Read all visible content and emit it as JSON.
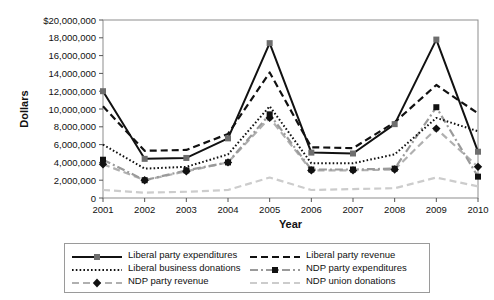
{
  "chart_data": {
    "type": "line",
    "title": "",
    "xlabel": "Year",
    "ylabel": "Dollars",
    "x": [
      2001,
      2002,
      2003,
      2004,
      2005,
      2006,
      2007,
      2008,
      2009,
      2010
    ],
    "categories": [
      "2001",
      "2002",
      "2003",
      "2004",
      "2005",
      "2006",
      "2007",
      "2008",
      "2009",
      "2010"
    ],
    "ylim": [
      0,
      20000000
    ],
    "ytick_values": [
      0,
      2000000,
      4000000,
      6000000,
      8000000,
      10000000,
      12000000,
      14000000,
      16000000,
      18000000,
      20000000
    ],
    "ytick_labels": [
      "0",
      "2,000,000",
      "4,000,000",
      "6,000,000",
      "8,000,000",
      "10,000,000",
      "12,000,000",
      "14,000,000",
      "16,000,000",
      "18,000,000",
      "$20,000,000"
    ],
    "grid": false,
    "legend_position": "bottom",
    "series": [
      {
        "name": "Liberal party expenditures",
        "color": "#111111",
        "dash": "solid",
        "marker": "square",
        "marker_color": "#6e6e6e",
        "values": [
          12000000,
          4400000,
          4500000,
          6700000,
          17400000,
          5100000,
          5000000,
          8300000,
          17800000,
          5200000
        ]
      },
      {
        "name": "Liberal party revenue",
        "color": "#111111",
        "dash": "dashed",
        "marker": "none",
        "marker_color": "#8a8a8a",
        "values": [
          10300000,
          5300000,
          5400000,
          7200000,
          14100000,
          5700000,
          5600000,
          8500000,
          12700000,
          9500000
        ]
      },
      {
        "name": "Liberal business donations",
        "color": "#111111",
        "dash": "dotted",
        "marker": "none",
        "marker_color": "#8a8a8a",
        "values": [
          6000000,
          3300000,
          3500000,
          4900000,
          10300000,
          3900000,
          3900000,
          4900000,
          9000000,
          7500000
        ]
      },
      {
        "name": "NDP party expenditures",
        "color": "#9a9a9a",
        "dash": "dashdot",
        "marker": "square",
        "marker_color": "#111111",
        "values": [
          4300000,
          2000000,
          3100000,
          4000000,
          9400000,
          3200000,
          3200000,
          3300000,
          10200000,
          2400000
        ]
      },
      {
        "name": "NDP party revenue",
        "color": "#b0b0b0",
        "dash": "dashed",
        "marker": "diamond",
        "marker_color": "#111111",
        "values": [
          3800000,
          2000000,
          3000000,
          4000000,
          9000000,
          3100000,
          3100000,
          3200000,
          7800000,
          3500000
        ]
      },
      {
        "name": "NDP union donations",
        "color": "#cccccc",
        "dash": "dashed",
        "marker": "none",
        "marker_color": "#cccccc",
        "values": [
          900000,
          600000,
          700000,
          900000,
          2300000,
          900000,
          1000000,
          1100000,
          2300000,
          1300000
        ]
      }
    ]
  },
  "legend": {
    "items": [
      "Liberal party expenditures",
      "Liberal party revenue",
      "Liberal business donations",
      "NDP party expenditures",
      "NDP party revenue",
      "NDP union donations"
    ]
  }
}
